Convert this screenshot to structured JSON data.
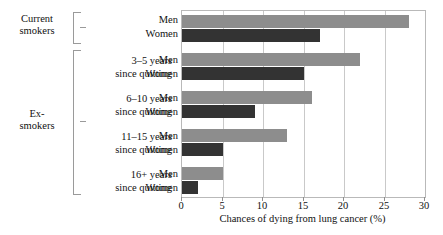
{
  "chart_data": {
    "type": "bar",
    "orientation": "horizontal",
    "title": "",
    "xlabel": "Chances of dying from lung cancer (%)",
    "ylabel": "",
    "xlim": [
      0,
      30
    ],
    "xticks": [
      0,
      5,
      10,
      15,
      20,
      25,
      30
    ],
    "grid": true,
    "legend": "none",
    "series": [
      {
        "name": "Men",
        "color": "#8d8d8d",
        "values": [
          28,
          22,
          16,
          13,
          5
        ]
      },
      {
        "name": "Women",
        "color": "#333333",
        "values": [
          17,
          15,
          9,
          5,
          2
        ]
      }
    ],
    "categories": [
      "Current smokers",
      "3–5 years since quitting",
      "6–10 years since quitting",
      "11–15 years since quitting",
      "16+ years since quitting"
    ],
    "groups": [
      {
        "group_label": "Current\nsmokers",
        "period_label": "",
        "rows": [
          {
            "sex": "Men",
            "value": 28
          },
          {
            "sex": "Women",
            "value": 17
          }
        ]
      },
      {
        "group_label": "Ex-\nsmokers",
        "period_label": "3–5 years\nsince quitting",
        "rows": [
          {
            "sex": "Men",
            "value": 22
          },
          {
            "sex": "Women",
            "value": 15
          }
        ]
      },
      {
        "group_label": "",
        "period_label": "6–10 years\nsince quitting",
        "rows": [
          {
            "sex": "Men",
            "value": 16
          },
          {
            "sex": "Women",
            "value": 9
          }
        ]
      },
      {
        "group_label": "",
        "period_label": "11–15 years\nsince quitting",
        "rows": [
          {
            "sex": "Men",
            "value": 13
          },
          {
            "sex": "Women",
            "value": 5
          }
        ]
      },
      {
        "group_label": "",
        "period_label": "16+ years\nsince quitting",
        "rows": [
          {
            "sex": "Men",
            "value": 5
          },
          {
            "sex": "Women",
            "value": 2
          }
        ]
      }
    ]
  },
  "labels": {
    "group_current": "Current\nsmokers",
    "group_ex": "Ex-\nsmokers",
    "period_3_5": "3–5 years\nsince quitting",
    "period_6_10": "6–10 years\nsince quitting",
    "period_11_15": "11–15 years\nsince quitting",
    "period_16_plus": "16+ years\nsince quitting",
    "men": "Men",
    "women": "Women",
    "x_axis_title": "Chances of dying from lung cancer (%)"
  },
  "axis": {
    "tick_0": "0",
    "tick_5": "5",
    "tick_10": "10",
    "tick_15": "15",
    "tick_20": "20",
    "tick_25": "25",
    "tick_30": "30"
  },
  "colors": {
    "men_bar": "#8d8d8d",
    "women_bar": "#333333",
    "gridline": "#c9c9c9",
    "frame": "#b9b9b9",
    "bracket": "#9a9a9a"
  }
}
